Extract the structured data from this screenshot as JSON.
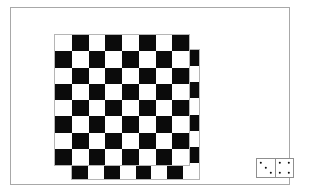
{
  "scene": {
    "title": "Two overlapping checkerboards and a domino",
    "background_color": "#ffffff",
    "frame": {
      "name": "outer-frame",
      "border_color": "#a8a8a8",
      "x": 10,
      "y": 7,
      "width": 280,
      "height": 178
    },
    "light_square_color": "#ffffff",
    "dark_square_color": "#0b0b0b",
    "board_border_color": "#b5b5b5",
    "boards": [
      {
        "id": "board-back",
        "label": "rear checkerboard",
        "rows": 8,
        "cols": 8,
        "x": 60,
        "y": 41,
        "width": 129,
        "height": 131,
        "top_left_square": "light"
      },
      {
        "id": "board-front",
        "label": "front checkerboard",
        "rows": 8,
        "cols": 8,
        "x": 43,
        "y": 26,
        "width": 136,
        "height": 132,
        "top_left_square": "light"
      }
    ],
    "domino": {
      "id": "domino",
      "label": "domino tile",
      "x": 245,
      "y": 150,
      "width": 38,
      "height": 20,
      "border_color": "#8f8f8f",
      "pip_color": "#0b0b0b",
      "halves": [
        {
          "id": "domino-half-left",
          "label": "left half",
          "pip_count": 3,
          "pips": [
            {
              "x": 22,
              "y": 22
            },
            {
              "x": 50,
              "y": 50
            },
            {
              "x": 78,
              "y": 78
            }
          ]
        },
        {
          "id": "domino-half-right",
          "label": "right half",
          "pip_count": 4,
          "pips": [
            {
              "x": 24,
              "y": 22
            },
            {
              "x": 76,
              "y": 22
            },
            {
              "x": 24,
              "y": 78
            },
            {
              "x": 76,
              "y": 78
            }
          ]
        }
      ]
    }
  }
}
